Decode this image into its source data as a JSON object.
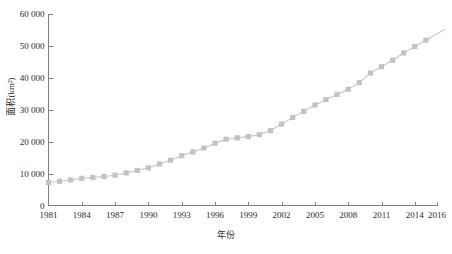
{
  "chart_data": {
    "type": "line",
    "title": "",
    "xlabel": "年份",
    "ylabel": "面积(km²)",
    "xlim": [
      1981,
      2016
    ],
    "ylim": [
      0,
      60000
    ],
    "grid": false,
    "legend": null,
    "marker": "square",
    "marker_color": "#c2c2c6",
    "line_color": "#c6c6ca",
    "axis_color": "#808080",
    "x_ticks": [
      "1981",
      "1984",
      "1987",
      "1990",
      "1993",
      "1996",
      "1999",
      "2002",
      "2005",
      "2008",
      "2011",
      "2014",
      "2016"
    ],
    "x_tick_values": [
      1981,
      1984,
      1987,
      1990,
      1993,
      1996,
      1999,
      2002,
      2005,
      2008,
      2011,
      2014,
      2016
    ],
    "y_ticks": [
      "0",
      "10 000",
      "20 000",
      "30 000",
      "40 000",
      "50 000",
      "60 000"
    ],
    "y_tick_values": [
      0,
      10000,
      20000,
      30000,
      40000,
      50000,
      60000
    ],
    "x": [
      1981,
      1982,
      1983,
      1984,
      1985,
      1986,
      1987,
      1988,
      1989,
      1990,
      1991,
      1992,
      1993,
      1994,
      1995,
      1996,
      1997,
      1998,
      1999,
      2000,
      2001,
      2002,
      2003,
      2004,
      2005,
      2006,
      2007,
      2008,
      2009,
      2010,
      2011,
      2012,
      2013,
      2014,
      2015
    ],
    "values": [
      7200,
      7600,
      8000,
      8500,
      8800,
      9100,
      9500,
      10200,
      11000,
      11800,
      13000,
      14200,
      15600,
      16800,
      18000,
      19500,
      20800,
      21200,
      21600,
      22200,
      23500,
      25500,
      27600,
      29500,
      31500,
      33200,
      34800,
      36400,
      38500,
      41500,
      43500,
      45500,
      47800,
      49800,
      51800
    ],
    "series_name": "面积"
  }
}
